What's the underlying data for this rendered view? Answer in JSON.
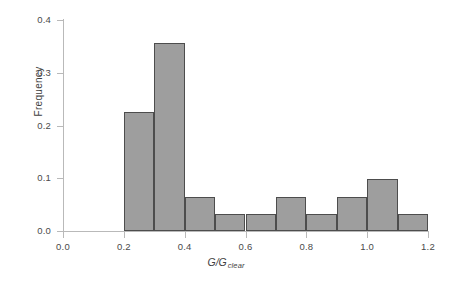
{
  "chart_data": {
    "type": "bar",
    "title": "",
    "xlabel": "G/G_clear",
    "xlabel_main": "G/G",
    "xlabel_sub": "clear",
    "ylabel": "Frequency",
    "xlim": [
      0.0,
      1.2
    ],
    "ylim": [
      0.0,
      0.4
    ],
    "grid": false,
    "legend": "none",
    "bin_width": 0.1,
    "bin_edges": [
      0.2,
      0.3,
      0.4,
      0.5,
      0.6,
      0.7,
      0.8,
      0.9,
      1.0,
      1.1,
      1.2
    ],
    "categories": [
      "0.2-0.3",
      "0.3-0.4",
      "0.4-0.5",
      "0.5-0.6",
      "0.6-0.7",
      "0.7-0.8",
      "0.8-0.9",
      "0.9-1.0",
      "1.0-1.1",
      "1.1-1.2"
    ],
    "values": [
      0.225,
      0.357,
      0.065,
      0.032,
      0.032,
      0.065,
      0.032,
      0.065,
      0.099,
      0.032
    ],
    "xticks": [
      0.0,
      0.2,
      0.4,
      0.6,
      0.8,
      1.0,
      1.2
    ],
    "xticklabels": [
      "0.0",
      "0.2",
      "0.4",
      "0.6",
      "0.8",
      "1.0",
      "1.2"
    ],
    "yticks": [
      0.0,
      0.1,
      0.2,
      0.3,
      0.4
    ],
    "yticklabels": [
      "0.0",
      "0.1",
      "0.2",
      "0.3",
      "0.4"
    ],
    "bar_fill_color": "#9e9e9e",
    "bar_edge_color": "#4d4d4d",
    "axis_color": "#b9b9b9",
    "background_color": "#ffffff"
  }
}
